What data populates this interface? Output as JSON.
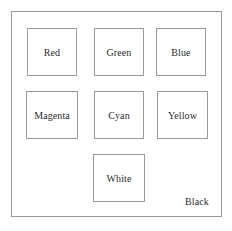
{
  "figure": {
    "clipped_header_fragment": "",
    "frame": {
      "border_color": "#9a9a9a",
      "background_color": "#ffffff"
    },
    "boxes": [
      {
        "id": "red",
        "label": "Red",
        "row": 1,
        "col": 1
      },
      {
        "id": "green",
        "label": "Green",
        "row": 1,
        "col": 2
      },
      {
        "id": "blue",
        "label": "Blue",
        "row": 1,
        "col": 3
      },
      {
        "id": "magenta",
        "label": "Magenta",
        "row": 2,
        "col": 1
      },
      {
        "id": "cyan",
        "label": "Cyan",
        "row": 2,
        "col": 2
      },
      {
        "id": "yellow",
        "label": "Yellow",
        "row": 2,
        "col": 3
      },
      {
        "id": "white",
        "label": "White",
        "row": 3,
        "col": 2
      }
    ],
    "unboxed_labels": [
      {
        "id": "black",
        "label": "Black",
        "position": "bottom-right"
      }
    ],
    "colors": {
      "text": "#2b2b2b",
      "stroke": "#9a9a9a",
      "page_background": "#ffffff"
    }
  }
}
